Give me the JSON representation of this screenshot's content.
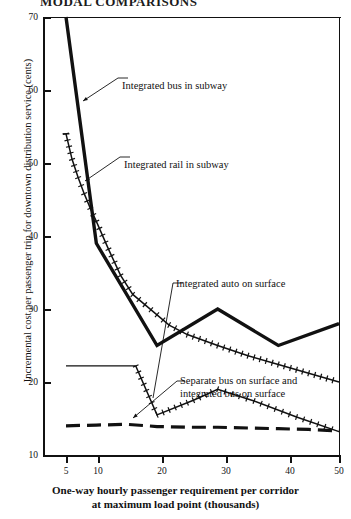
{
  "page": {
    "title_fragment": "MODAL COMPARISONS"
  },
  "chart_data": {
    "type": "line",
    "title": "",
    "xlabel": "One-way hourly passenger requirement per corridor at maximum load point (thousands)",
    "xlabel_line1": "One-way hourly passenger requirement per corridor",
    "xlabel_line2": "at maximum load point (thousands)",
    "ylabel": "Incremental cost per passenger trip for downtown distribution service (cents)",
    "xlim": [
      3.5,
      50
    ],
    "ylim": [
      10,
      70
    ],
    "xticks": [
      5,
      10,
      20,
      30,
      40,
      50
    ],
    "xtick_labels": [
      "5",
      "10",
      "20",
      "30",
      "40",
      "50"
    ],
    "yticks": [
      10,
      20,
      30,
      40,
      50,
      60,
      70
    ],
    "ytick_labels": [
      "10",
      "20",
      "30",
      "40",
      "50",
      "60",
      "70"
    ],
    "grid": false,
    "legend": "annotations-on-plot",
    "series": [
      {
        "name": "Integrated bus in subway",
        "style": "thick-solid",
        "x": [
          5,
          10,
          20,
          30,
          40,
          50
        ],
        "values": [
          70,
          39,
          25,
          30,
          25,
          28
        ]
      },
      {
        "name": "Integrated rail in subway",
        "style": "cross-hatched-line",
        "x": [
          5,
          6,
          7,
          8,
          9,
          10,
          12,
          14,
          16,
          18,
          20,
          22,
          25,
          30,
          35,
          40,
          45,
          50
        ],
        "values": [
          54,
          50.5,
          48,
          45.8,
          43.8,
          42,
          38.2,
          34.6,
          32,
          30.6,
          29.2,
          27.8,
          26.5,
          25,
          23.6,
          22.4,
          21.2,
          20
        ]
      },
      {
        "name": "Integrated auto on surface",
        "style": "thin-solid-plus-peak",
        "x": [
          5,
          16.5,
          20,
          26,
          30,
          36,
          43,
          50
        ],
        "values": [
          22.2,
          22.2,
          15.5,
          17.5,
          19,
          17.4,
          15.2,
          13.2
        ]
      },
      {
        "name": "Separate bus on surface and integrated bus on surface",
        "style": "dashed",
        "x": [
          5,
          10,
          15,
          20,
          25,
          30,
          35,
          40,
          45,
          50
        ],
        "values": [
          14,
          14.1,
          14.2,
          13.9,
          13.8,
          13.8,
          13.7,
          13.6,
          13.5,
          13.3
        ]
      }
    ],
    "annotations": [
      {
        "id": "ann-bus-subway",
        "text": "Integrated bus in subway",
        "label_x": 122,
        "label_y": 80,
        "target_x": 83,
        "target_y": 101
      },
      {
        "id": "ann-rail-subway",
        "text": "Integrated rail in subway",
        "label_x": 124,
        "label_y": 159,
        "target_x": 85,
        "target_y": 181
      },
      {
        "id": "ann-auto-surface",
        "text": "Integrated auto on surface",
        "label_x": 176,
        "label_y": 278,
        "target_x": 153,
        "target_y": 398
      },
      {
        "id": "ann-sep-bus-surface",
        "text_line1": "Separate bus on surface and",
        "text_line2": "integrated bus on surface",
        "label_x": 180,
        "label_y": 375,
        "target_x": 100,
        "target_y": 355
      }
    ]
  },
  "colors": {
    "ink": "#111111",
    "background": "#ffffff"
  }
}
